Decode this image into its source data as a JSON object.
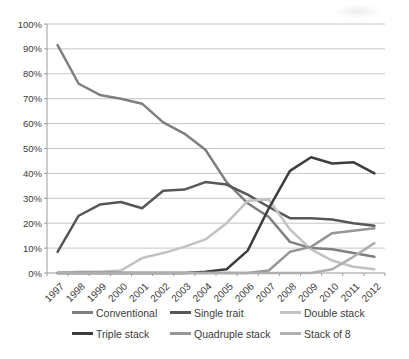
{
  "chart_data": {
    "type": "line",
    "title": "",
    "xlabel": "",
    "ylabel": "",
    "categories": [
      "1997",
      "1998",
      "1999",
      "2000",
      "2001",
      "2002",
      "2003",
      "2004",
      "2005",
      "2006",
      "2007",
      "2008",
      "2009",
      "2010",
      "2011",
      "2012"
    ],
    "series": [
      {
        "name": "Conventional",
        "color": "#7f7f7f",
        "values": [
          91.5,
          76,
          71.5,
          70,
          68,
          60.5,
          56,
          49.5,
          36.5,
          28,
          22.5,
          12.5,
          10,
          9.5,
          8,
          6.5
        ]
      },
      {
        "name": "Single trait",
        "color": "#575757",
        "values": [
          8.5,
          23,
          27.5,
          28.5,
          26,
          33,
          33.5,
          36.5,
          35.5,
          31.5,
          26.5,
          22,
          22,
          21.5,
          20,
          19
        ]
      },
      {
        "name": "Double stack",
        "color": "#c2c2c2",
        "values": [
          0,
          0.5,
          0.5,
          1,
          6,
          8,
          10.5,
          13.5,
          20,
          29,
          29.5,
          17.5,
          9.5,
          5,
          2.5,
          1.5
        ]
      },
      {
        "name": "Triple stack",
        "color": "#3d3d3d",
        "values": [
          0,
          0,
          0,
          0,
          0,
          0,
          0,
          0.5,
          1.5,
          9,
          26,
          41,
          46.5,
          44,
          44.5,
          40
        ]
      },
      {
        "name": "Quadruple stack",
        "color": "#969696",
        "values": [
          0,
          0,
          0,
          0,
          0,
          0,
          0,
          0,
          0,
          0,
          1,
          8.5,
          10.5,
          16,
          17,
          18
        ]
      },
      {
        "name": "Stack of 8",
        "color": "#aeaeae",
        "values": [
          0,
          0,
          0,
          0,
          0,
          0,
          0,
          0,
          0,
          0,
          0,
          0,
          0,
          1.5,
          6.5,
          12
        ]
      }
    ],
    "ylim": [
      0,
      100
    ],
    "ytick_step": 10,
    "ytick_labels": [
      "0%",
      "10%",
      "20%",
      "30%",
      "40%",
      "50%",
      "60%",
      "70%",
      "80%",
      "90%",
      "100%"
    ],
    "grid": true,
    "gridline_color": "#c6c6c6",
    "axis_color": "#9b9b9b",
    "legend_position": "bottom",
    "legend_columns": 3
  }
}
